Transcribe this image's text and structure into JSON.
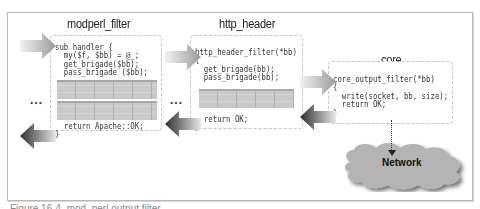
{
  "diagram": {
    "filters": [
      {
        "title": "modperl_filter",
        "code_top": "sub handler {\n  my($f, $bb) = @_;\n  get_brigade($bb);\n  pass_brigade ($bb);",
        "code_bottom": "  return Apache::OK;\n}"
      },
      {
        "title": "http_header",
        "code_top": "http_header_filter(*bb)\n{\n  get_brigade(bb);\n  pass_brigade(bb);",
        "code_bottom": "  return OK;\n}"
      },
      {
        "title": "core",
        "code_top": "core_output_filter(*bb)\n{\n  write(socket, bb, size);\n  return OK;\n}"
      }
    ],
    "ellipsis": "...",
    "network_label": "Network",
    "caption": "Figure 16-4. mod_perl output filter"
  }
}
